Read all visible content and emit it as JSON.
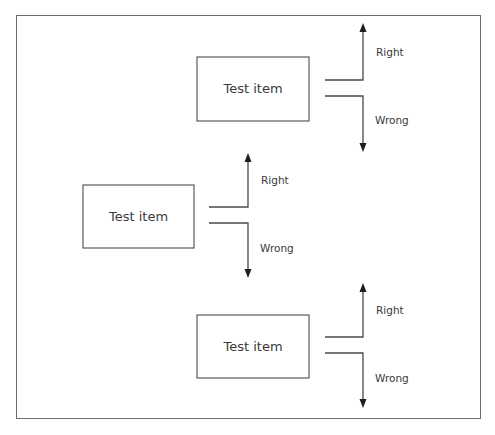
{
  "diagram": {
    "title": "",
    "nodes": [
      {
        "id": "item1",
        "label": "Test item",
        "right_label": "Right",
        "wrong_label": "Wrong"
      },
      {
        "id": "item2",
        "label": "Test item",
        "right_label": "Right",
        "wrong_label": "Wrong"
      },
      {
        "id": "item3",
        "label": "Test item",
        "right_label": "Right",
        "wrong_label": "Wrong"
      }
    ],
    "colors": {
      "border": "#6e6e6e",
      "line": "#4a4a4a",
      "arrowhead": "#1e1e1e",
      "text": "#3a3a3a"
    }
  }
}
